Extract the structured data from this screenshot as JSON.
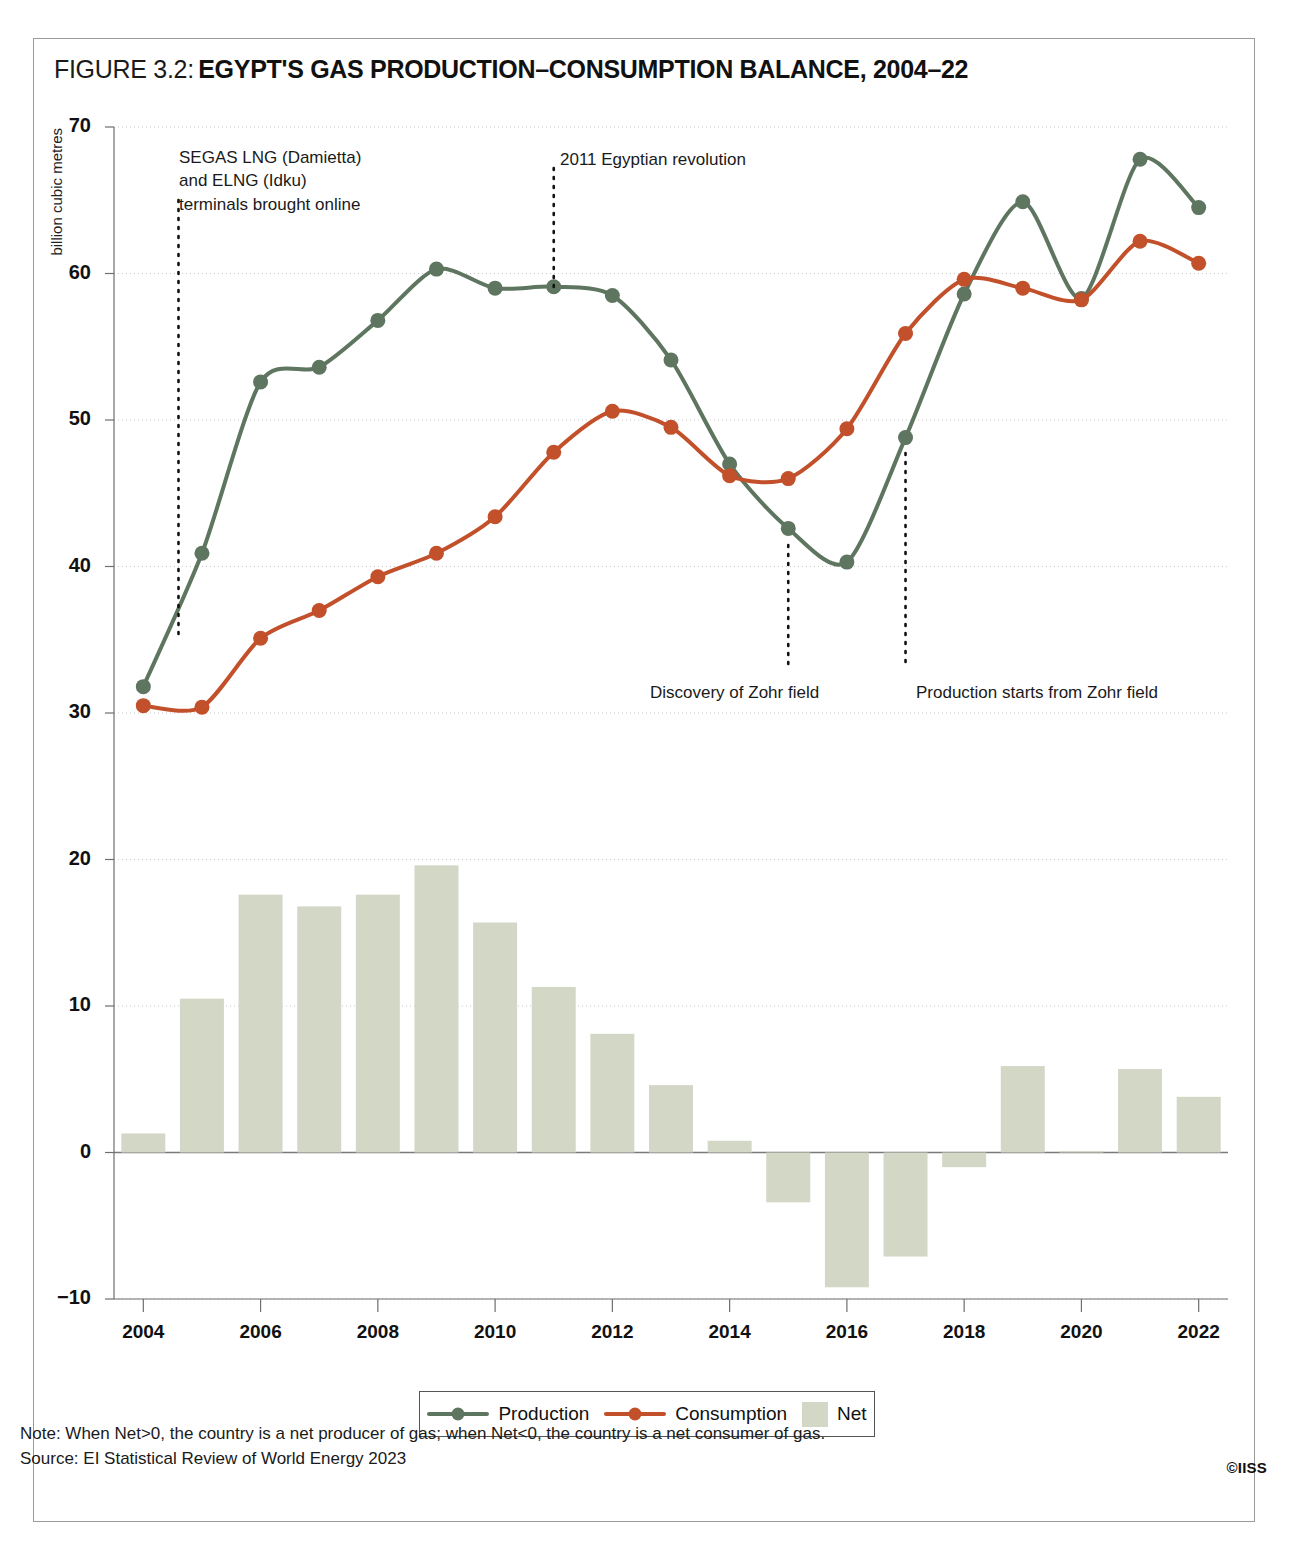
{
  "figure": {
    "label": "FIGURE 3.2:",
    "title": "EGYPT'S GAS PRODUCTION–CONSUMPTION BALANCE, 2004–22"
  },
  "note": "Note: When Net>0, the country is a net producer of gas; when Net<0, the country is a net consumer of gas.",
  "source": "Source: EI Statistical Review of World Energy 2023",
  "copyright": "©IISS",
  "legend": {
    "production": "Production",
    "consumption": "Consumption",
    "net": "Net"
  },
  "colors": {
    "production": "#5e7560",
    "consumption": "#c2502a",
    "net": "#d3d8c6",
    "grid": "#c9c9c9",
    "axis": "#6e6e6e",
    "frame": "#9a9a9a"
  },
  "annotations": [
    {
      "id": "segas-elng",
      "text": "SEGAS LNG (Damietta)\nand ELNG (Idku)\nterminals brought online",
      "year": 2004.6,
      "text_x": 179,
      "text_y": 146,
      "line_top": 200,
      "line_bottom": 638
    },
    {
      "id": "revolution",
      "text": "2011 Egyptian revolution",
      "year": 2011.0,
      "text_x": 560,
      "text_y": 148,
      "line_top": 168,
      "line_bottom": 288
    },
    {
      "id": "zohr-discovery",
      "text": "Discovery of Zohr field",
      "year": 2015.0,
      "text_x": 650,
      "text_y": 681,
      "line_top": 545,
      "line_bottom": 668
    },
    {
      "id": "zohr-production",
      "text": "Production starts from Zohr field",
      "year": 2017.0,
      "text_x": 916,
      "text_y": 681,
      "line_top": 453,
      "line_bottom": 668
    }
  ],
  "chart_data": {
    "type": "line",
    "title": "EGYPT'S GAS PRODUCTION–CONSUMPTION BALANCE, 2004–22",
    "xlabel": "",
    "ylabel": "billion cubic metres",
    "ylim": [
      -10,
      70
    ],
    "xlim": [
      2003.5,
      2022.5
    ],
    "yticks": [
      70,
      60,
      50,
      40,
      30,
      20,
      10,
      0,
      -10
    ],
    "xticks": [
      2004,
      2006,
      2008,
      2010,
      2012,
      2014,
      2016,
      2018,
      2020,
      2022
    ],
    "grid": true,
    "legend_position": "bottom",
    "x": [
      2004,
      2005,
      2006,
      2007,
      2008,
      2009,
      2010,
      2011,
      2012,
      2013,
      2014,
      2015,
      2016,
      2017,
      2018,
      2019,
      2020,
      2021,
      2022
    ],
    "series": [
      {
        "name": "Production",
        "type": "line",
        "color": "#5e7560",
        "values": [
          31.8,
          40.9,
          52.6,
          53.6,
          56.8,
          60.3,
          59.0,
          59.1,
          58.5,
          54.1,
          47.0,
          42.6,
          40.3,
          48.8,
          58.6,
          64.9,
          58.3,
          67.8,
          64.5
        ]
      },
      {
        "name": "Consumption",
        "type": "line",
        "color": "#c2502a",
        "values": [
          30.5,
          30.4,
          35.1,
          37.0,
          39.3,
          40.9,
          43.4,
          47.8,
          50.6,
          49.5,
          46.2,
          46.0,
          49.4,
          55.9,
          59.6,
          59.0,
          58.2,
          62.2,
          60.7
        ]
      },
      {
        "name": "Net",
        "type": "bar",
        "color": "#d3d8c6",
        "values": [
          1.3,
          10.5,
          17.6,
          16.8,
          17.6,
          19.6,
          15.7,
          11.3,
          8.1,
          4.6,
          0.8,
          -3.4,
          -9.2,
          -7.1,
          -1.0,
          5.9,
          0.1,
          5.7,
          3.8
        ]
      }
    ]
  }
}
